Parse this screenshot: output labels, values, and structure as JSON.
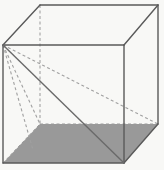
{
  "figure": {
    "shape_name": "cube",
    "projection": "oblique-parallel",
    "canvas": {
      "width": 164,
      "height": 170
    },
    "colors": {
      "background": "#f8f8f6",
      "solid_edge": "#5a5a5a",
      "hidden_edge": "#9a9a9a",
      "diagonal_solid": "#6a6a6a",
      "diagonal_hidden": "#a0a0a0",
      "base_fill": "#999999"
    },
    "stroke_widths": {
      "solid_edge": 1.4,
      "hidden_edge": 1,
      "diagonal": 1.3
    },
    "dash_pattern": "3 2.5",
    "vertices": {
      "front_top_left": {
        "x": 3,
        "y": 45
      },
      "front_top_right": {
        "x": 124,
        "y": 45
      },
      "front_bottom_left": {
        "x": 3,
        "y": 163
      },
      "front_bottom_right": {
        "x": 124,
        "y": 163
      },
      "back_top_left": {
        "x": 40,
        "y": 5
      },
      "back_top_right": {
        "x": 158,
        "y": 5
      },
      "back_bottom_left": {
        "x": 40,
        "y": 124
      },
      "back_bottom_right": {
        "x": 158,
        "y": 124
      }
    },
    "faces": {
      "bottom_shaded": {
        "fill": "#999999",
        "points": "3,163 124,163 158,124 40,124"
      }
    },
    "edges_solid": [
      {
        "name": "front-top",
        "from": "front_top_left",
        "to": "front_top_right"
      },
      {
        "name": "front-left",
        "from": "front_top_left",
        "to": "front_bottom_left"
      },
      {
        "name": "front-right",
        "from": "front_top_right",
        "to": "front_bottom_right"
      },
      {
        "name": "front-bottom",
        "from": "front_bottom_left",
        "to": "front_bottom_right"
      },
      {
        "name": "top-left-slant",
        "from": "front_top_left",
        "to": "back_top_left"
      },
      {
        "name": "top-right-slant",
        "from": "front_top_right",
        "to": "back_top_right"
      },
      {
        "name": "back-top",
        "from": "back_top_left",
        "to": "back_top_right"
      },
      {
        "name": "back-right-vertical",
        "from": "back_top_right",
        "to": "back_bottom_right"
      },
      {
        "name": "bottom-right-slant",
        "from": "front_bottom_right",
        "to": "back_bottom_right"
      }
    ],
    "edges_hidden": [
      {
        "name": "back-left-vertical",
        "from": "back_top_left",
        "to": "back_bottom_left"
      },
      {
        "name": "back-bottom",
        "from": "back_bottom_left",
        "to": "back_bottom_right"
      },
      {
        "name": "bottom-left-slant",
        "from": "front_bottom_left",
        "to": "back_bottom_left"
      }
    ],
    "diagonals": [
      {
        "name": "face-diagonal-front",
        "style": "solid",
        "from": "front_top_left",
        "to": "front_bottom_right",
        "description": "solid diagonal across the front face"
      },
      {
        "name": "edge-diagonal-to-back-bottom-left",
        "style": "dashed",
        "from": "front_top_left",
        "to": "back_bottom_left",
        "description": "hidden diagonal across the left face"
      },
      {
        "name": "space-diagonal",
        "style": "dashed",
        "from": "front_top_left",
        "to": "back_bottom_right",
        "description": "hidden space diagonal through the interior of the cube"
      },
      {
        "name": "edge-to-back-bottom-left-lower",
        "style": "dashed",
        "from": "front_top_left",
        "to": "front_bottom_left_offset",
        "description": "hidden diagonal toward the lower-left base corner"
      }
    ],
    "extra_points": {
      "front_bottom_left_offset": {
        "x": 33,
        "y": 150
      }
    }
  }
}
